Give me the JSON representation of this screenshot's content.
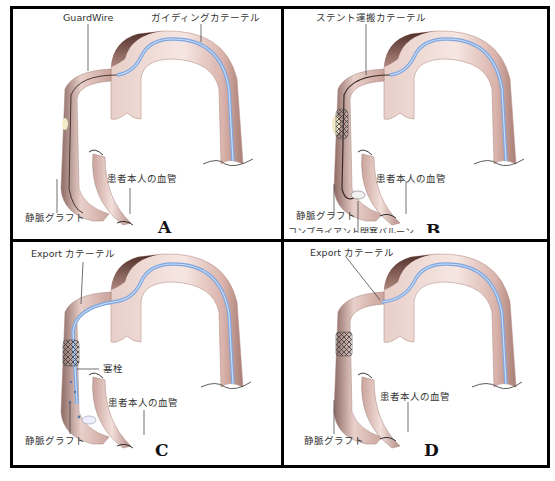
{
  "figure": {
    "colors": {
      "border": "#000000",
      "vessel_light": "#f3dcd6",
      "vessel_mid": "#d6b0a8",
      "vessel_dark": "#5a3a34",
      "catheter_blue": "#7fa6e0",
      "catheter_blue_light": "#c8dcf5",
      "stent": "#555555",
      "plaque": "#f3ecc8"
    },
    "panels": [
      {
        "id": "A",
        "letter": "A",
        "labels": {
          "wire": "GuardWire",
          "guiding_catheter": "ガイディングカテーテル",
          "native_vessel": "患者本人の血管",
          "vein_graft": "静脈グラフト"
        }
      },
      {
        "id": "B",
        "letter": "B",
        "labels": {
          "stent_catheter": "ステント運搬カテーテル",
          "native_vessel": "患者本人の血管",
          "vein_graft": "静脈グラフト",
          "occlusion_balloon": "コンプライアント閉塞バルーン"
        }
      },
      {
        "id": "C",
        "letter": "C",
        "labels": {
          "export_catheter": "Export カテーテル",
          "embolus": "塞栓",
          "native_vessel": "患者本人の血管",
          "vein_graft": "静脈グラフト"
        }
      },
      {
        "id": "D",
        "letter": "D",
        "labels": {
          "export_catheter": "Export カテーテル",
          "native_vessel": "患者本人の血管",
          "vein_graft": "静脈グラフト"
        }
      }
    ]
  }
}
